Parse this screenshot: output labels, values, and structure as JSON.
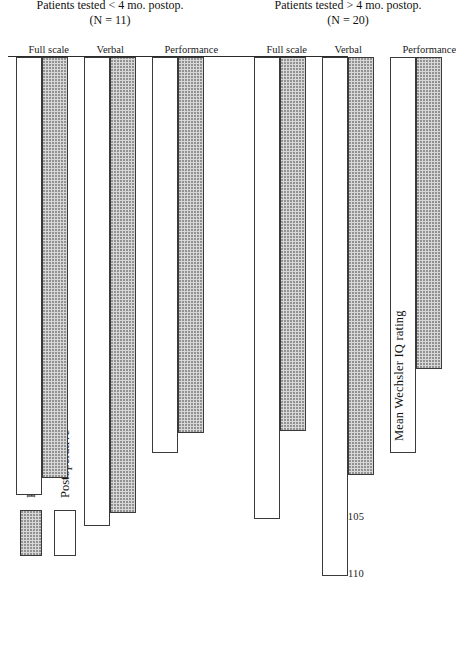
{
  "chart_data": {
    "type": "bar",
    "orientation": "horizontal",
    "title": "",
    "xlabel": "Mean Wechsler IQ rating",
    "ylabel": "",
    "axis_break": true,
    "axis_break_note": "//",
    "tick_labels": [
      "110",
      "105",
      "100",
      "95",
      "90",
      "0"
    ],
    "tick_values": [
      110,
      105,
      100,
      95,
      90,
      0
    ],
    "xlim": [
      88,
      112
    ],
    "grid": false,
    "legend_position": "top-left",
    "series": [
      {
        "name": "Preoperative",
        "key": "pre",
        "fill": "stippled"
      },
      {
        "name": "Postoperative",
        "key": "post",
        "fill": "white"
      }
    ],
    "groups": [
      {
        "caption_line1": "Patients tested < 4 mo. postop.",
        "caption_line2": "(N = 11)",
        "categories": [
          "Full scale",
          "Verbal",
          "Performance"
        ],
        "values_pre": [
          102.1,
          105.2,
          98.2
        ],
        "values_post": [
          103.6,
          106.3,
          100.0
        ]
      },
      {
        "caption_line1": "Patients tested > 4 mo. postop.",
        "caption_line2": "(N = 20)",
        "categories": [
          "Full scale",
          "Verbal",
          "Performance"
        ],
        "values_pre": [
          98.0,
          101.9,
          92.6
        ],
        "values_post": [
          105.7,
          110.7,
          100.0
        ]
      }
    ]
  },
  "legend": {
    "items": [
      {
        "label": "Preoperative"
      },
      {
        "label": "Postoperative"
      }
    ]
  },
  "colors": {
    "ink": "#1a1a1a",
    "bar_outline": "#3a3a3a",
    "preoperative_fill": "#d8d8d8",
    "postoperative_fill": "#ffffff",
    "page_background": "#ffffff"
  }
}
